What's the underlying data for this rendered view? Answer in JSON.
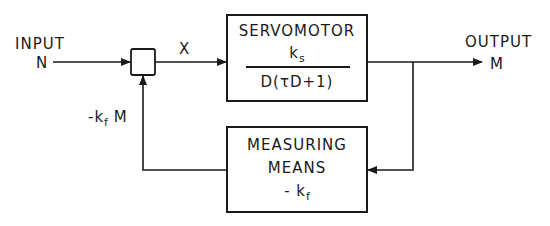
{
  "diagram": {
    "type": "block-diagram",
    "input": {
      "label": "INPUT",
      "symbol": "N"
    },
    "output": {
      "label": "OUTPUT",
      "symbol": "M"
    },
    "summing_junction": {
      "output_signal": "X"
    },
    "forward_block": {
      "name": "SERVOMOTOR",
      "numerator": "k",
      "numerator_sub": "s",
      "denominator": "D(τD+1)"
    },
    "feedback_block": {
      "line1": "MEASURING",
      "line2": "MEANS",
      "gain": "- k",
      "gain_sub": "f"
    },
    "feedback_signal": {
      "prefix": "-k",
      "sub": "f",
      "suffix": " M"
    },
    "colors": {
      "line": "#1a1a1a",
      "background": "#ffffff"
    }
  }
}
